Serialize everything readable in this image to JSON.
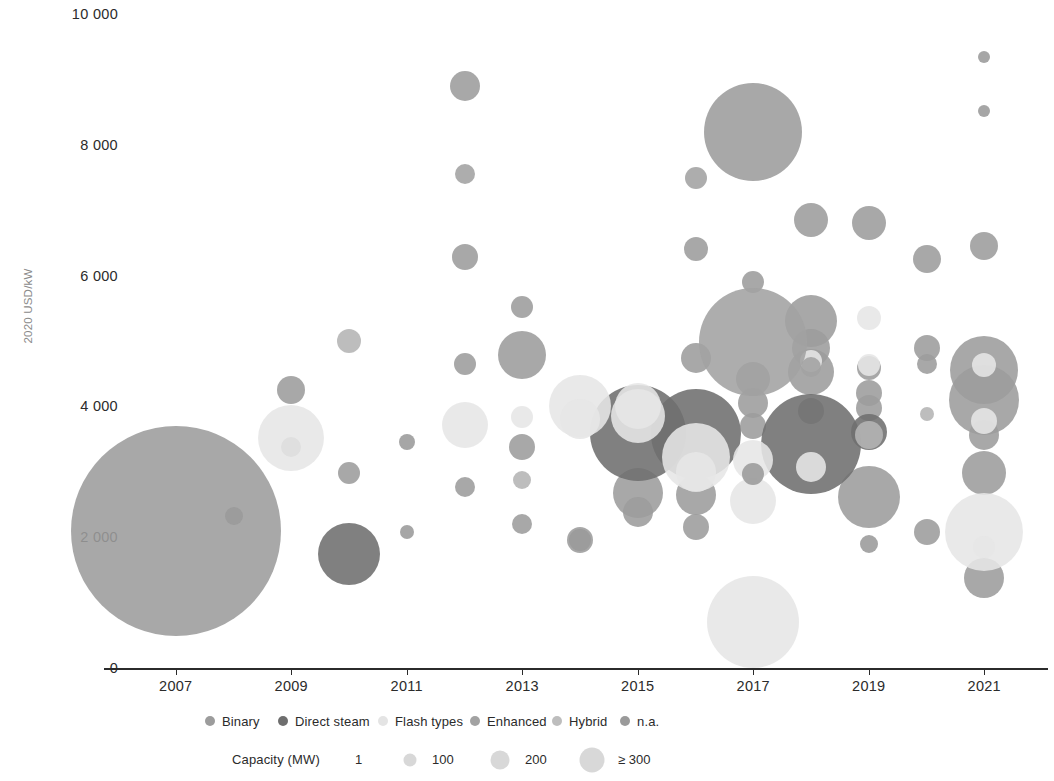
{
  "chart_data": {
    "type": "scatter",
    "title": "",
    "xlabel": "",
    "ylabel": "2020 USD/kW",
    "xlim": [
      2006,
      2022
    ],
    "ylim": [
      0,
      10000
    ],
    "grid": false,
    "legend_position": "bottom",
    "x_ticks": [
      "2007",
      "2009",
      "2011",
      "2013",
      "2015",
      "2017",
      "2019",
      "2021"
    ],
    "x_tick_values": [
      2007,
      2009,
      2011,
      2013,
      2015,
      2017,
      2019,
      2021
    ],
    "y_ticks": [
      "0",
      "2 000",
      "4 000",
      "6 000",
      "8 000",
      "10 000"
    ],
    "y_tick_values": [
      0,
      2000,
      4000,
      6000,
      8000,
      10000
    ],
    "size_encoding": {
      "label": "Capacity (MW)",
      "breaks": [
        "1",
        "100",
        "200",
        "≥ 300"
      ],
      "break_values": [
        1,
        100,
        200,
        300
      ]
    },
    "series": [
      {
        "name": "Binary",
        "color": "#9c9c9c",
        "points": [
          {
            "x": 2007,
            "y": 2100,
            "size": 210
          },
          {
            "x": 2009,
            "y": 4250,
            "size": 28
          },
          {
            "x": 2009,
            "y": 3380,
            "size": 20
          },
          {
            "x": 2010,
            "y": 2980,
            "size": 22
          },
          {
            "x": 2012,
            "y": 8900,
            "size": 30
          },
          {
            "x": 2012,
            "y": 6280,
            "size": 26
          },
          {
            "x": 2012,
            "y": 4650,
            "size": 22
          },
          {
            "x": 2012,
            "y": 2760,
            "size": 20
          },
          {
            "x": 2013,
            "y": 5520,
            "size": 22
          },
          {
            "x": 2013,
            "y": 4780,
            "size": 48
          },
          {
            "x": 2013,
            "y": 3380,
            "size": 26
          },
          {
            "x": 2013,
            "y": 2200,
            "size": 20
          },
          {
            "x": 2014,
            "y": 1950,
            "size": 26
          },
          {
            "x": 2015,
            "y": 3930,
            "size": 32
          },
          {
            "x": 2015,
            "y": 2680,
            "size": 50
          },
          {
            "x": 2015,
            "y": 2380,
            "size": 30
          },
          {
            "x": 2016,
            "y": 6400,
            "size": 24
          },
          {
            "x": 2016,
            "y": 4740,
            "size": 30
          },
          {
            "x": 2016,
            "y": 2640,
            "size": 40
          },
          {
            "x": 2016,
            "y": 2150,
            "size": 26
          },
          {
            "x": 2017,
            "y": 8200,
            "size": 98
          },
          {
            "x": 2017,
            "y": 5900,
            "size": 22
          },
          {
            "x": 2017,
            "y": 4420,
            "size": 34
          },
          {
            "x": 2017,
            "y": 4050,
            "size": 30
          },
          {
            "x": 2017,
            "y": 3700,
            "size": 26
          },
          {
            "x": 2018,
            "y": 6850,
            "size": 34
          },
          {
            "x": 2018,
            "y": 5300,
            "size": 52
          },
          {
            "x": 2018,
            "y": 4900,
            "size": 38
          },
          {
            "x": 2018,
            "y": 4520,
            "size": 46
          },
          {
            "x": 2018,
            "y": 3930,
            "size": 26
          },
          {
            "x": 2019,
            "y": 6800,
            "size": 34
          },
          {
            "x": 2019,
            "y": 4580,
            "size": 24
          },
          {
            "x": 2019,
            "y": 4200,
            "size": 26
          },
          {
            "x": 2019,
            "y": 3980,
            "size": 26
          },
          {
            "x": 2019,
            "y": 2620,
            "size": 62
          },
          {
            "x": 2020,
            "y": 6250,
            "size": 28
          },
          {
            "x": 2020,
            "y": 4900,
            "size": 26
          },
          {
            "x": 2020,
            "y": 4650,
            "size": 20
          },
          {
            "x": 2020,
            "y": 2080,
            "size": 26
          },
          {
            "x": 2021,
            "y": 6450,
            "size": 28
          },
          {
            "x": 2021,
            "y": 4550,
            "size": 68
          },
          {
            "x": 2021,
            "y": 4100,
            "size": 70
          },
          {
            "x": 2021,
            "y": 3560,
            "size": 30
          },
          {
            "x": 2021,
            "y": 2980,
            "size": 44
          },
          {
            "x": 2021,
            "y": 1370,
            "size": 40
          }
        ]
      },
      {
        "name": "Direct steam",
        "color": "#6e6e6e",
        "points": [
          {
            "x": 2010,
            "y": 1740,
            "size": 62
          },
          {
            "x": 2015,
            "y": 3600,
            "size": 96
          },
          {
            "x": 2016,
            "y": 3580,
            "size": 90
          },
          {
            "x": 2018,
            "y": 3420,
            "size": 100
          },
          {
            "x": 2019,
            "y": 3610,
            "size": 36
          }
        ]
      },
      {
        "name": "Flash types",
        "color": "#e6e6e6",
        "points": [
          {
            "x": 2009,
            "y": 3520,
            "size": 66
          },
          {
            "x": 2012,
            "y": 3720,
            "size": 46
          },
          {
            "x": 2013,
            "y": 3840,
            "size": 22
          },
          {
            "x": 2014,
            "y": 4000,
            "size": 62
          },
          {
            "x": 2014,
            "y": 3800,
            "size": 40
          },
          {
            "x": 2015,
            "y": 4000,
            "size": 46
          },
          {
            "x": 2015,
            "y": 3850,
            "size": 54
          },
          {
            "x": 2016,
            "y": 3230,
            "size": 68
          },
          {
            "x": 2016,
            "y": 3000,
            "size": 40
          },
          {
            "x": 2017,
            "y": 3180,
            "size": 40
          },
          {
            "x": 2017,
            "y": 2560,
            "size": 46
          },
          {
            "x": 2017,
            "y": 700,
            "size": 92
          },
          {
            "x": 2018,
            "y": 3080,
            "size": 30
          },
          {
            "x": 2018,
            "y": 4700,
            "size": 22
          },
          {
            "x": 2019,
            "y": 5350,
            "size": 24
          },
          {
            "x": 2019,
            "y": 4640,
            "size": 22
          },
          {
            "x": 2021,
            "y": 4640,
            "size": 24
          },
          {
            "x": 2021,
            "y": 3780,
            "size": 26
          },
          {
            "x": 2021,
            "y": 2080,
            "size": 78
          },
          {
            "x": 2021,
            "y": 1850,
            "size": 22
          }
        ]
      },
      {
        "name": "Enhanced",
        "color": "#a2a2a2",
        "points": [
          {
            "x": 2012,
            "y": 7550,
            "size": 20
          },
          {
            "x": 2016,
            "y": 7500,
            "size": 22
          },
          {
            "x": 2017,
            "y": 4980,
            "size": 108
          },
          {
            "x": 2018,
            "y": 4600,
            "size": 20
          }
        ]
      },
      {
        "name": "Hybrid",
        "color": "#b4b4b4",
        "points": [
          {
            "x": 2010,
            "y": 5000,
            "size": 24
          },
          {
            "x": 2013,
            "y": 2880,
            "size": 18
          },
          {
            "x": 2019,
            "y": 3560,
            "size": 28
          },
          {
            "x": 2020,
            "y": 3880,
            "size": 14
          }
        ]
      },
      {
        "name": "n.a.",
        "color": "#9a9a9a",
        "points": [
          {
            "x": 2008,
            "y": 2330,
            "size": 18
          },
          {
            "x": 2011,
            "y": 3450,
            "size": 16
          },
          {
            "x": 2011,
            "y": 2080,
            "size": 14
          },
          {
            "x": 2014,
            "y": 1950,
            "size": 22
          },
          {
            "x": 2017,
            "y": 2960,
            "size": 22
          },
          {
            "x": 2021,
            "y": 9350,
            "size": 12
          },
          {
            "x": 2021,
            "y": 8520,
            "size": 12
          },
          {
            "x": 2019,
            "y": 1900,
            "size": 18
          }
        ]
      }
    ]
  },
  "axis": {
    "ylabel": "2020 USD/kW"
  },
  "legend": {
    "items": [
      {
        "label": "Binary",
        "color": "#9c9c9c"
      },
      {
        "label": "Direct steam",
        "color": "#6e6e6e"
      },
      {
        "label": "Flash types",
        "color": "#e4e4e4"
      },
      {
        "label": "Enhanced",
        "color": "#a2a2a2"
      },
      {
        "label": "Hybrid",
        "color": "#bdbdbd"
      },
      {
        "label": "n.a.",
        "color": "#9a9a9a"
      }
    ]
  },
  "size_legend": {
    "title": "Capacity (MW)",
    "items": [
      {
        "label": "1",
        "size": 4
      },
      {
        "label": "100",
        "size": 13
      },
      {
        "label": "200",
        "size": 19
      },
      {
        "label": "≥ 300",
        "size": 25
      }
    ]
  }
}
